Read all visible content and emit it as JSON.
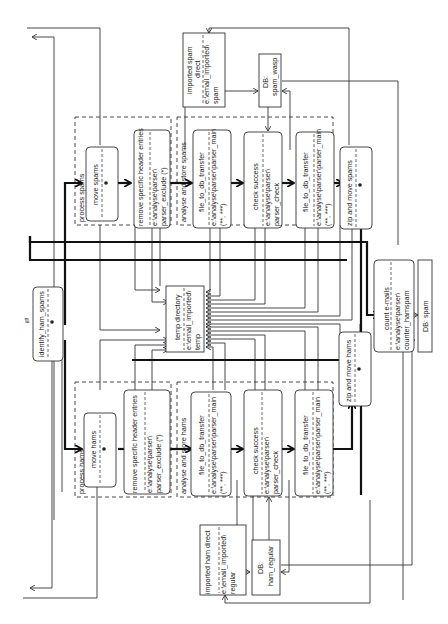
{
  "diagram": {
    "orientation": "rotated-90-ccw",
    "colors": {
      "line": "#333333",
      "background": "#ffffff"
    },
    "groups": [
      {
        "id": "process_spams",
        "label": "process spams"
      },
      {
        "id": "analyse_store_spams",
        "label": "analyse and store spams"
      },
      {
        "id": "process_hams",
        "label": "process hams"
      },
      {
        "id": "analyse_store_hams",
        "label": "analyse and store hams"
      }
    ],
    "nodes": {
      "identify": {
        "title": "identify_ham_spams"
      },
      "move_spams": {
        "title": "move spams"
      },
      "remove_spam_headers": {
        "title": "remove specific header entries",
        "path1": "e:\\analyse\\parser\\",
        "path2": "parser_exclude (*)"
      },
      "spam_transfer1": {
        "title": "file_to_db_transfer",
        "path1": "e:\\analyse\\parser\\parser_main",
        "path2": "(**, ***)"
      },
      "spam_check": {
        "title": "check success",
        "path1": "e:\\analyse\\parser\\",
        "path2": "parser_check"
      },
      "spam_transfer2": {
        "title": "file_to_db_transfer",
        "path1": "e:\\analyse\\parser\\parser_main",
        "path2": "(**, ***)"
      },
      "zip_spams": {
        "title": "zip and move spams"
      },
      "imported_spam": {
        "line1": "imported spam",
        "line2": "direct",
        "line3": "e:\\email_imported\\",
        "line4": "spam"
      },
      "db_spam_wasp": {
        "line1": "DB:",
        "line2": "spam_wasp"
      },
      "temp_dir": {
        "title": "temp directory",
        "path1": "e:\\email_imported\\",
        "path2": "temp"
      },
      "move_hams": {
        "title": "move hams"
      },
      "remove_ham_headers": {
        "title": "remove specific header entries",
        "path1": "e:\\analyse\\parser\\",
        "path2": "parser_exclude (*)"
      },
      "ham_transfer1": {
        "title": "file_to_db_transfer",
        "path1": "e:\\analyse\\parser\\parser_main",
        "path2": "(**, ***)"
      },
      "ham_check": {
        "title": "check success",
        "path1": "e:\\analyse\\parser\\",
        "path2": "parser_check"
      },
      "ham_transfer2": {
        "title": "file_to_db_transfer",
        "path1": "e:\\analyse\\parser\\parser_main",
        "path2": "(**, ***)"
      },
      "zip_hams": {
        "title": "zip and move hams"
      },
      "imported_ham": {
        "line1": "imported ham direct",
        "line2": "e:\\email_imported\\",
        "line3": "regular"
      },
      "db_ham_regular": {
        "line1": "DB:",
        "line2": "ham_regular"
      },
      "count_emails": {
        "title": "count e-mails",
        "path1": "e:\\analyse\\parser\\",
        "path2": "counter_hamspam"
      },
      "db_spam": {
        "title": "DB: spam"
      }
    }
  }
}
